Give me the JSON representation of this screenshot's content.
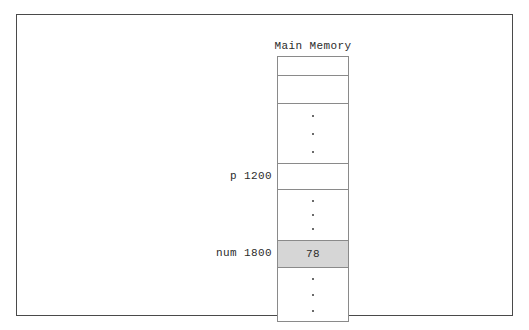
{
  "figure": {
    "title": "Main Memory",
    "colors": {
      "frame_border": "#4a4a4a",
      "cell_border": "#8a8a8a",
      "highlight_fill": "#d6d6d6",
      "text": "#2b2b2b",
      "background": "#ffffff"
    }
  },
  "memory": {
    "cells": [
      {
        "id": "cell-top-1",
        "label": "",
        "value": "",
        "kind": "empty"
      },
      {
        "id": "cell-top-2",
        "label": "",
        "value": "",
        "kind": "empty"
      },
      {
        "id": "cell-ellipsis-1",
        "label": "",
        "value": "",
        "kind": "ellipsis"
      },
      {
        "id": "cell-p",
        "label": "p 1200",
        "value": "",
        "kind": "empty"
      },
      {
        "id": "cell-ellipsis-2",
        "label": "",
        "value": "",
        "kind": "ellipsis"
      },
      {
        "id": "cell-num",
        "label": "num 1800",
        "value": "78",
        "kind": "highlighted"
      },
      {
        "id": "cell-ellipsis-3",
        "label": "",
        "value": "",
        "kind": "ellipsis"
      }
    ]
  },
  "labels": {
    "pointer": "p 1200",
    "variable": "num 1800"
  },
  "values": {
    "num_value": "78"
  }
}
